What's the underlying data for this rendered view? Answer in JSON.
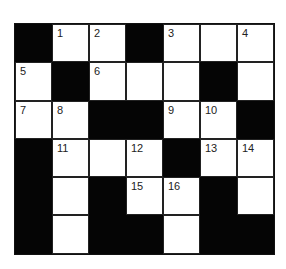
{
  "puzzle": {
    "type": "crossword",
    "rows": 6,
    "cols": 7,
    "colors": {
      "black": "#050505",
      "white": "#ffffff",
      "line": "#222222"
    },
    "grid": [
      [
        {
          "b": true
        },
        {
          "n": "1"
        },
        {
          "n": "2"
        },
        {
          "b": true
        },
        {
          "n": "3"
        },
        {
          "n": ""
        },
        {
          "n": "4"
        }
      ],
      [
        {
          "n": "5"
        },
        {
          "b": true
        },
        {
          "n": "6"
        },
        {
          "n": ""
        },
        {
          "n": ""
        },
        {
          "b": true
        },
        {
          "n": ""
        }
      ],
      [
        {
          "n": "7"
        },
        {
          "n": "8"
        },
        {
          "b": true
        },
        {
          "b": true
        },
        {
          "n": "9"
        },
        {
          "n": "10"
        },
        {
          "b": true
        }
      ],
      [
        {
          "b": true
        },
        {
          "n": "11"
        },
        {
          "n": ""
        },
        {
          "n": "12"
        },
        {
          "b": true
        },
        {
          "n": "13"
        },
        {
          "n": "14"
        }
      ],
      [
        {
          "b": true
        },
        {
          "n": ""
        },
        {
          "b": true
        },
        {
          "n": "15"
        },
        {
          "n": "16"
        },
        {
          "b": true
        },
        {
          "n": ""
        }
      ],
      [
        {
          "b": true
        },
        {
          "n": ""
        },
        {
          "b": true
        },
        {
          "b": true
        },
        {
          "n": ""
        },
        {
          "b": true
        },
        {
          "b": true
        }
      ]
    ]
  }
}
